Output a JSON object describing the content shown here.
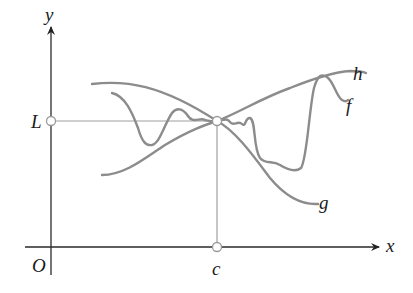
{
  "figure": {
    "axes": {
      "x_label": "x",
      "y_label": "y",
      "origin_label": "O"
    },
    "points": {
      "limit_label": "L",
      "point_label": "c"
    },
    "curves": [
      {
        "name": "h",
        "label": "h",
        "role": "upper bound"
      },
      {
        "name": "f",
        "label": "f",
        "role": "squeezed function"
      },
      {
        "name": "g",
        "label": "g",
        "role": "lower bound"
      }
    ],
    "colors": {
      "axis": "#2a2a2a",
      "curve": "#8c8c8c",
      "guide": "#9a9a9a",
      "label": "#1a1a1a"
    }
  }
}
